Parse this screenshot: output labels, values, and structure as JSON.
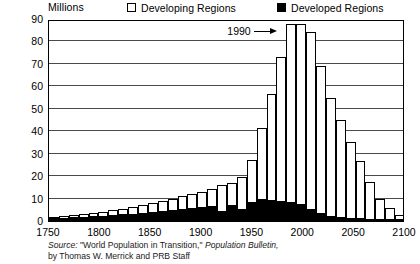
{
  "legend": {
    "unit_label": "Millions",
    "entries": [
      {
        "label": "Developing Regions",
        "swatch": "hollow-square-icon",
        "color": "#ffffff"
      },
      {
        "label": "Developed Regions",
        "swatch": "filled-square-icon",
        "color": "#000000"
      }
    ]
  },
  "annotation": {
    "label": "1990",
    "arrow": "right-arrow-icon"
  },
  "source": {
    "line1_prefix": "Source: ",
    "line1_quote": "\"World Population in Transition,\" ",
    "line1_italic": "Population Bulletin,",
    "line2": "by Thomas W. Merrick and PRB Staff"
  },
  "chart_data": {
    "type": "bar",
    "title": "",
    "subtitle": "",
    "xlabel": "",
    "ylabel": "Millions",
    "stacked": true,
    "grid": true,
    "legend_position": "top",
    "xlim": [
      1750,
      2100
    ],
    "ylim": [
      0,
      90
    ],
    "ytick_labels": [
      "0",
      "10",
      "20",
      "30",
      "40",
      "50",
      "60",
      "70",
      "80",
      "90"
    ],
    "ytick_values": [
      0,
      10,
      20,
      30,
      40,
      50,
      60,
      70,
      80,
      90
    ],
    "xtick_labels": [
      "1750",
      "1800",
      "1850",
      "1900",
      "1950",
      "2000",
      "2050",
      "2100"
    ],
    "xtick_values": [
      1750,
      1800,
      1850,
      1900,
      1950,
      2000,
      2050,
      2100
    ],
    "categories": [
      1750,
      1760,
      1770,
      1780,
      1790,
      1800,
      1810,
      1820,
      1830,
      1840,
      1850,
      1860,
      1870,
      1880,
      1890,
      1900,
      1910,
      1920,
      1930,
      1940,
      1950,
      1960,
      1970,
      1980,
      1990,
      2000,
      2010,
      2020,
      2030,
      2040,
      2050,
      2060,
      2070,
      2080,
      2090,
      2100
    ],
    "series": [
      {
        "name": "Developed Regions",
        "color": "#000000",
        "values": [
          1.0,
          1.1,
          1.3,
          1.5,
          1.7,
          1.9,
          2.2,
          2.5,
          2.9,
          3.3,
          3.7,
          4.1,
          4.5,
          5.0,
          5.4,
          5.8,
          6.2,
          4.0,
          6.8,
          5.0,
          8.0,
          9.5,
          9.0,
          8.5,
          8.0,
          7.0,
          5.0,
          3.0,
          2.0,
          1.5,
          1.0,
          0.8,
          0.6,
          0.5,
          0.4,
          0.3
        ]
      },
      {
        "name": "Developing Regions",
        "color": "#ffffff",
        "values": [
          1.0,
          1.2,
          1.4,
          1.6,
          1.9,
          2.2,
          2.6,
          3.0,
          3.4,
          3.9,
          4.4,
          4.9,
          5.4,
          6.0,
          6.6,
          7.2,
          8.0,
          12.0,
          10.2,
          14.5,
          19.0,
          32.0,
          47.5,
          64.5,
          80.0,
          81.0,
          79.0,
          66.0,
          53.0,
          43.5,
          34.0,
          26.0,
          17.0,
          9.5,
          5.5,
          2.5
        ]
      }
    ],
    "totals": [
      2.0,
      2.3,
      2.7,
      3.1,
      3.6,
      4.1,
      4.8,
      5.5,
      6.3,
      7.2,
      8.1,
      9.0,
      9.9,
      11.0,
      12.0,
      13.0,
      14.2,
      16.0,
      17.0,
      19.5,
      27.0,
      41.5,
      56.5,
      73.0,
      88.0,
      88.0,
      84.0,
      69.0,
      55.0,
      45.0,
      35.0,
      26.8,
      17.6,
      10.0,
      5.9,
      2.8
    ]
  }
}
